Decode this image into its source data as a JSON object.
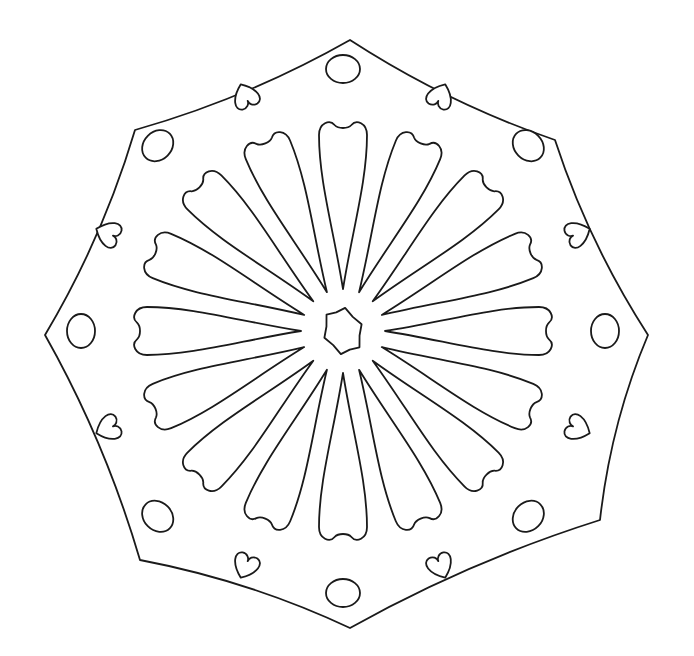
{
  "image": {
    "kind": "mandala-coloring-page",
    "background": "#ffffff",
    "line_color": "#1a1a1a",
    "center": [
      343,
      331
    ],
    "outline_vertices": [
      [
        350,
        40
      ],
      [
        555,
        140
      ],
      [
        648,
        335
      ],
      [
        600,
        520
      ],
      [
        350,
        628
      ],
      [
        140,
        560
      ],
      [
        45,
        335
      ],
      [
        135,
        130
      ]
    ],
    "petal_count": 16,
    "ornament_count": 16,
    "ornament_types": [
      "oval",
      "heart"
    ]
  }
}
